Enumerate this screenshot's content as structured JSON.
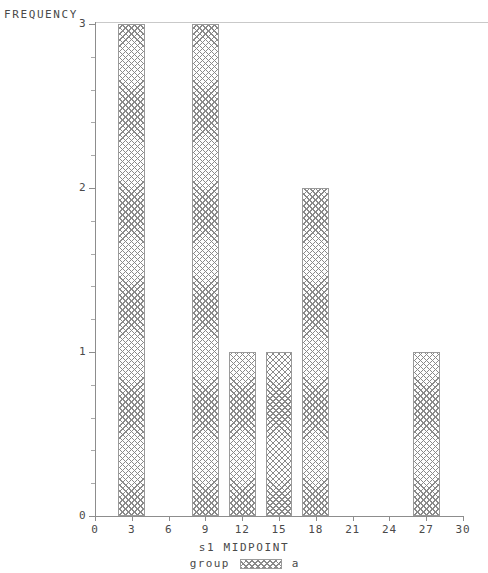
{
  "chart_data": {
    "type": "bar",
    "title": "",
    "subtitle": "",
    "xlabel": "s1 MIDPOINT",
    "ylabel": "FREQUENCY",
    "categories": [
      3,
      9,
      12,
      15,
      18,
      27
    ],
    "values": [
      3,
      3,
      1,
      1,
      2,
      1
    ],
    "bar_width": 2.2,
    "xlim": [
      0,
      30
    ],
    "ylim": [
      0,
      3
    ],
    "x_ticks": [
      "0",
      "3",
      "6",
      "9",
      "12",
      "15",
      "18",
      "21",
      "24",
      "27",
      "30"
    ],
    "x_tick_values": [
      0,
      3,
      6,
      9,
      12,
      15,
      18,
      21,
      24,
      27,
      30
    ],
    "y_ticks": [
      "0",
      "1",
      "2",
      "3"
    ],
    "y_tick_values": [
      0,
      1,
      2,
      3
    ],
    "y_minor_per_major": 5,
    "grid": false,
    "legend_position": "bottom",
    "legend": {
      "title": "group",
      "entries": [
        {
          "label": "a",
          "pattern": "cross-hatch",
          "color": "#8a8a8a"
        }
      ]
    },
    "series": [
      {
        "name": "a",
        "values": [
          {
            "midpoint": 3,
            "frequency": 3
          },
          {
            "midpoint": 9,
            "frequency": 3
          },
          {
            "midpoint": 12,
            "frequency": 1
          },
          {
            "midpoint": 15,
            "frequency": 1
          },
          {
            "midpoint": 18,
            "frequency": 2
          },
          {
            "midpoint": 27,
            "frequency": 1
          }
        ]
      }
    ]
  },
  "axes": {
    "y_title": "FREQUENCY",
    "x_title": "s1 MIDPOINT"
  },
  "legend": {
    "group_label": "group",
    "value_label": "a"
  },
  "colors": {
    "axis": "#8d8d8d",
    "text": "#4a4a4a",
    "bar_hatch": "#8a8a8a",
    "bar_border": "#9a9a9a",
    "background": "#ffffff"
  }
}
